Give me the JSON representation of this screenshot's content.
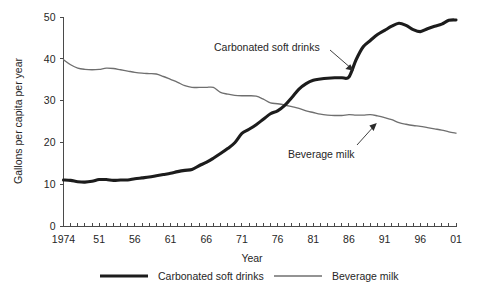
{
  "chart_data": {
    "type": "line",
    "title": "",
    "xlabel": "Year",
    "ylabel": "Gallons per capita per year",
    "xlim": [
      1946,
      2001
    ],
    "ylim": [
      0,
      50
    ],
    "grid": false,
    "legend_position": "bottom",
    "y_ticks": [
      "0",
      "10",
      "20",
      "30",
      "40",
      "50"
    ],
    "y_tick_values": [
      0,
      10,
      20,
      30,
      40,
      50
    ],
    "x_tick_labels": [
      "1974",
      "51",
      "56",
      "61",
      "66",
      "71",
      "76",
      "81",
      "86",
      "91",
      "96",
      "01"
    ],
    "x_tick_label_values": [
      1946,
      1951,
      1956,
      1961,
      1966,
      1971,
      1976,
      1981,
      1986,
      1991,
      1996,
      2001
    ],
    "x_minor_tick_interval": 1,
    "x": [
      1946,
      1947,
      1948,
      1949,
      1950,
      1951,
      1952,
      1953,
      1954,
      1955,
      1956,
      1957,
      1958,
      1959,
      1960,
      1961,
      1962,
      1963,
      1964,
      1965,
      1966,
      1967,
      1968,
      1969,
      1970,
      1971,
      1972,
      1973,
      1974,
      1975,
      1976,
      1977,
      1978,
      1979,
      1980,
      1981,
      1982,
      1983,
      1984,
      1985,
      1986,
      1987,
      1988,
      1989,
      1990,
      1991,
      1992,
      1993,
      1994,
      1995,
      1996,
      1997,
      1998,
      1999,
      2000,
      2001
    ],
    "series": [
      {
        "name": "Carbonated soft drinks",
        "color": "#1c1c1c",
        "line_width": "thick",
        "values": [
          11.1,
          11.0,
          10.7,
          10.6,
          10.8,
          11.2,
          11.2,
          11.0,
          11.1,
          11.1,
          11.4,
          11.6,
          11.8,
          12.1,
          12.4,
          12.7,
          13.1,
          13.4,
          13.6,
          14.5,
          15.3,
          16.3,
          17.4,
          18.6,
          20.0,
          22.2,
          23.2,
          24.3,
          25.6,
          26.9,
          27.6,
          28.9,
          30.8,
          32.8,
          34.1,
          34.9,
          35.2,
          35.4,
          35.5,
          35.5,
          35.7,
          39.8,
          42.9,
          44.4,
          45.8,
          46.8,
          47.8,
          48.5,
          48.0,
          47.0,
          46.5,
          47.2,
          47.8,
          48.3,
          49.2,
          49.3
        ]
      },
      {
        "name": "Beverage milk",
        "color": "#6f6f6f",
        "line_width": "thin",
        "values": [
          39.8,
          38.6,
          37.8,
          37.5,
          37.4,
          37.5,
          37.8,
          37.7,
          37.4,
          37.1,
          36.8,
          36.6,
          36.5,
          36.4,
          35.8,
          35.1,
          34.4,
          33.6,
          33.2,
          33.2,
          33.2,
          33.2,
          32.0,
          31.6,
          31.3,
          31.2,
          31.2,
          31.1,
          30.4,
          29.5,
          29.3,
          29.0,
          28.6,
          28.2,
          27.6,
          27.2,
          26.8,
          26.6,
          26.5,
          26.5,
          26.7,
          26.6,
          26.6,
          26.7,
          26.4,
          26.0,
          25.5,
          24.8,
          24.4,
          24.1,
          23.9,
          23.6,
          23.3,
          23.0,
          22.6,
          22.3
        ]
      }
    ],
    "annotations": [
      {
        "text": "Carbonated soft drinks",
        "target_series": "Carbonated soft drinks",
        "arrow": "points down-right to the dark soft-drink line near 1986"
      },
      {
        "text": "Beverage milk",
        "target_series": "Beverage milk",
        "arrow": "points up-right to the gray milk line near 1991"
      }
    ],
    "legend": [
      {
        "label": "Carbonated soft drinks",
        "color": "#1c1c1c",
        "line_width": "thick"
      },
      {
        "label": "Beverage milk",
        "color": "#6f6f6f",
        "line_width": "thin"
      }
    ]
  }
}
